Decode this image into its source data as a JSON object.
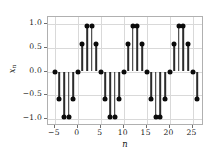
{
  "figure": {
    "background": "#ffffff",
    "marker_color": "#0b0b0b",
    "stem_color": "#2b2b2b",
    "grid_color": "#d9d9d9",
    "frame_color": "#b0b0b0"
  },
  "axis": {
    "xlabel": "n",
    "ylabel_main": "x",
    "ylabel_sub": "n"
  },
  "chart_data": {
    "type": "scatter",
    "plot_style": "stem",
    "title": "",
    "xlabel": "n",
    "ylabel": "x_n",
    "xlim": [
      -6.5,
      27.5
    ],
    "ylim": [
      -1.15,
      1.15
    ],
    "grid": true,
    "legend": null,
    "xticks": [
      -5,
      0,
      5,
      10,
      15,
      20,
      25
    ],
    "xticklabels": [
      "−5",
      "0",
      "5",
      "10",
      "15",
      "20",
      "25"
    ],
    "yticks": [
      -1.0,
      -0.5,
      0.0,
      0.5,
      1.0
    ],
    "yticklabels": [
      "−1.0",
      "−0.5",
      "0.0",
      "0.5",
      "1.0"
    ],
    "x": [
      -5,
      -4,
      -3,
      -2,
      -1,
      0,
      1,
      2,
      3,
      4,
      5,
      6,
      7,
      8,
      9,
      10,
      11,
      12,
      13,
      14,
      15,
      16,
      17,
      18,
      19,
      20,
      21,
      22,
      23,
      24,
      25,
      26
    ],
    "values": [
      0.0,
      -0.59,
      -0.95,
      -0.95,
      -0.59,
      0.0,
      0.59,
      0.95,
      0.95,
      0.59,
      0.0,
      -0.59,
      -0.95,
      -0.95,
      -0.59,
      0.0,
      0.59,
      0.95,
      0.95,
      0.59,
      0.0,
      -0.59,
      -0.95,
      -0.95,
      -0.59,
      0.0,
      0.59,
      0.95,
      0.95,
      0.59,
      0.0,
      -0.59
    ]
  }
}
